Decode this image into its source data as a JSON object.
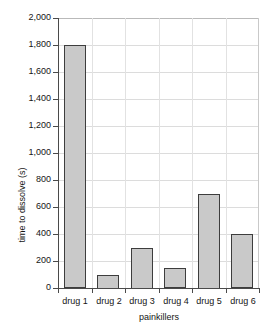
{
  "chart_data": {
    "type": "bar",
    "title": "",
    "subtitle": "",
    "xlabel": "painkillers",
    "ylabel": "time to dissolve (s)",
    "categories": [
      "drug 1",
      "drug 2",
      "drug 3",
      "drug 4",
      "drug 5",
      "drug 6"
    ],
    "values": [
      1800,
      100,
      300,
      150,
      700,
      400
    ],
    "ylim": [
      0,
      2000
    ],
    "ytick_step": 200,
    "ytick_labels": [
      "0",
      "200",
      "400",
      "600",
      "800",
      "1,000",
      "1,200",
      "1,400",
      "1,600",
      "1,800",
      "2,000"
    ],
    "ytick_values": [
      0,
      200,
      400,
      600,
      800,
      1000,
      1200,
      1400,
      1600,
      1800,
      2000
    ],
    "grid": "horizontal-and-vertical",
    "legend": "none",
    "bar_fill_color": "#c9c9c9",
    "bar_border_color": "#3d3d3d",
    "gridline_color": "#dcdcdc",
    "axis_color": "#4a4a4a",
    "background_color": "#ffffff"
  },
  "axis": {
    "y_title": "time to dissolve (s)",
    "x_title": "painkillers"
  }
}
